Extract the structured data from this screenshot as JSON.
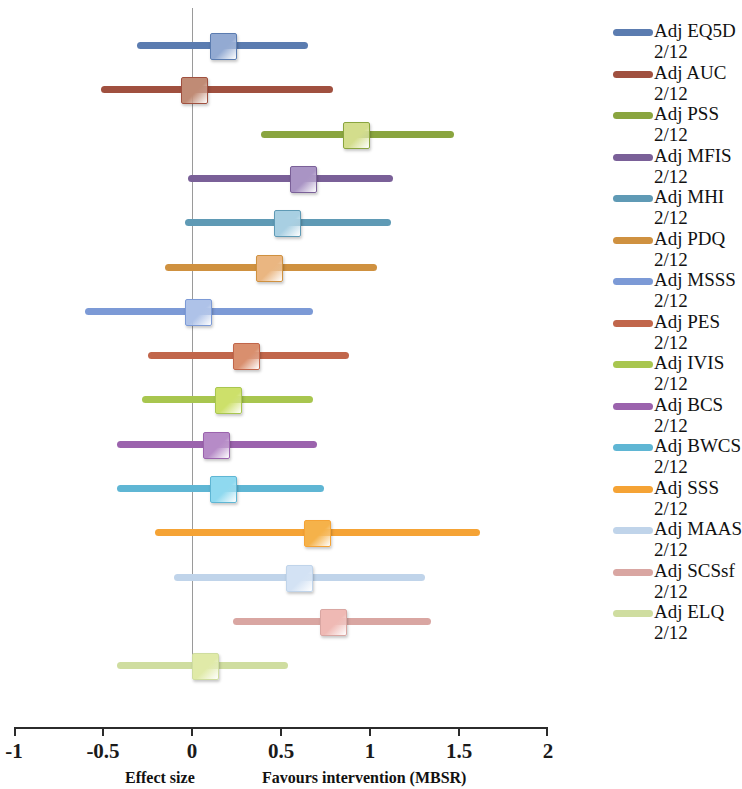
{
  "chart_data": {
    "type": "forest",
    "title": "",
    "xlabel": "Effect size",
    "ylabel": "",
    "xlim": [
      -1,
      2
    ],
    "xticks": [
      -1,
      -0.5,
      0,
      0.5,
      1,
      1.5,
      2
    ],
    "xtick_labels": [
      "-1",
      "-0.5",
      "0",
      "0.5",
      "1",
      "1.5",
      "2"
    ],
    "grid": false,
    "reference_line": 0,
    "annotations": [
      {
        "text": "Effect size",
        "position": "below-axis-left"
      },
      {
        "text": "Favours intervention (MBSR)",
        "position": "below-axis-right"
      }
    ],
    "legend_position": "right",
    "series": [
      {
        "name": "Adj EQ5D",
        "sub": "2/12",
        "estimate": 0.17,
        "ci_low": -0.31,
        "ci_high": 0.65,
        "color": "#5b7cb0"
      },
      {
        "name": "Adj AUC",
        "sub": "2/12",
        "estimate": 0.01,
        "ci_low": -0.51,
        "ci_high": 0.79,
        "color": "#a0503f"
      },
      {
        "name": "Adj PSS",
        "sub": "2/12",
        "estimate": 0.92,
        "ci_low": 0.39,
        "ci_high": 1.47,
        "color": "#8aa53f"
      },
      {
        "name": "Adj MFIS",
        "sub": "2/12",
        "estimate": 0.62,
        "ci_low": -0.02,
        "ci_high": 1.13,
        "color": "#7a6098"
      },
      {
        "name": "Adj MHI",
        "sub": "2/12",
        "estimate": 0.53,
        "ci_low": -0.04,
        "ci_high": 1.12,
        "color": "#5f9ab5"
      },
      {
        "name": "Adj PDQ",
        "sub": "2/12",
        "estimate": 0.43,
        "ci_low": -0.15,
        "ci_high": 1.04,
        "color": "#cf9140"
      },
      {
        "name": "Adj MSSS",
        "sub": "2/12",
        "estimate": 0.03,
        "ci_low": -0.6,
        "ci_high": 0.68,
        "color": "#7c9ad6"
      },
      {
        "name": "Adj PES",
        "sub": "2/12",
        "estimate": 0.3,
        "ci_low": -0.25,
        "ci_high": 0.88,
        "color": "#c1664b"
      },
      {
        "name": "Adj IVIS",
        "sub": "2/12",
        "estimate": 0.2,
        "ci_low": -0.28,
        "ci_high": 0.68,
        "color": "#a8c64f"
      },
      {
        "name": "Adj BCS",
        "sub": "2/12",
        "estimate": 0.13,
        "ci_low": -0.42,
        "ci_high": 0.7,
        "color": "#9b63ad"
      },
      {
        "name": "Adj BWCS",
        "sub": "2/12",
        "estimate": 0.17,
        "ci_low": -0.42,
        "ci_high": 0.74,
        "color": "#5fb6d4"
      },
      {
        "name": "Adj SSS",
        "sub": "2/12",
        "estimate": 0.7,
        "ci_low": -0.21,
        "ci_high": 1.62,
        "color": "#f5a335"
      },
      {
        "name": "Adj MAAS",
        "sub": "2/12",
        "estimate": 0.6,
        "ci_low": -0.1,
        "ci_high": 1.31,
        "color": "#c0d4ea"
      },
      {
        "name": "Adj SCSsf",
        "sub": "2/12",
        "estimate": 0.79,
        "ci_low": 0.23,
        "ci_high": 1.34,
        "color": "#d9a6a2"
      },
      {
        "name": "Adj ELQ",
        "sub": "2/12",
        "estimate": 0.07,
        "ci_low": -0.42,
        "ci_high": 0.54,
        "color": "#cfdda0"
      }
    ],
    "marker_colors": [
      "#93aad2",
      "#c08b75",
      "#d3dd8c",
      "#a994c4",
      "#a8cfe2",
      "#eab681",
      "#aec2e8",
      "#d98f6e",
      "#cde06a",
      "#b68bc7",
      "#8fd9ef",
      "#f5b24a",
      "#d3e2f4",
      "#efb9b4",
      "#e0eaa8"
    ]
  }
}
